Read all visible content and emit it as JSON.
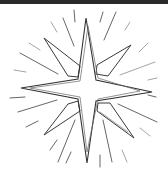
{
  "image": {
    "subject": "eight-pointed star with radiating light rays",
    "style": "black line drawing on white background",
    "colors": {
      "background": "#ffffff",
      "top_bar": "#2a2a2a",
      "line": "#333333",
      "faint_line": "#9a9a9a"
    }
  },
  "caption": ""
}
